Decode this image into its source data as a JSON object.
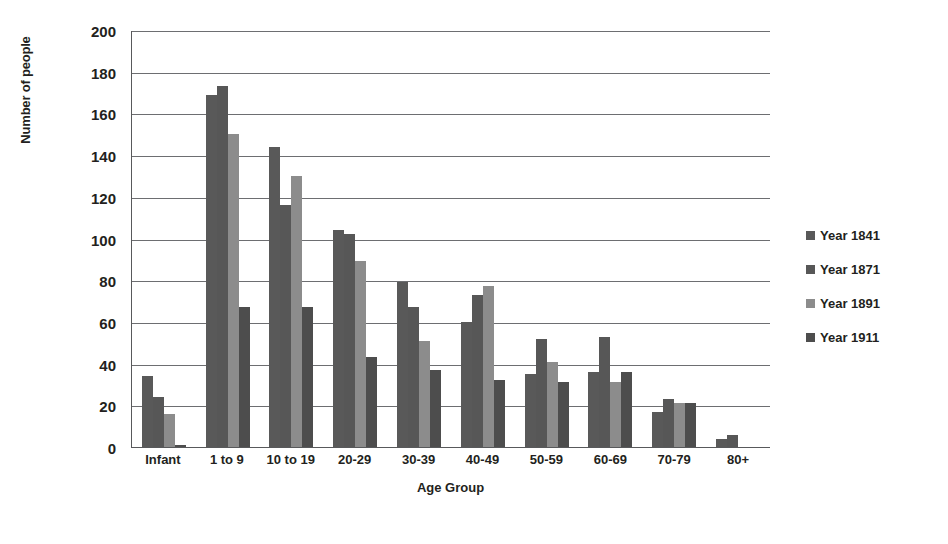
{
  "chart_data": {
    "type": "bar",
    "title": "",
    "xlabel": "Age Group",
    "ylabel": "Number of people",
    "ylim": [
      0,
      200
    ],
    "ytick_step": 20,
    "yticks": [
      200,
      180,
      160,
      140,
      120,
      100,
      80,
      60,
      40,
      20,
      0
    ],
    "grid": true,
    "legend_position": "right",
    "categories": [
      "Infant",
      "1 to 9",
      "10 to 19",
      "20-29",
      "30-39",
      "40-49",
      "50-59",
      "60-69",
      "70-79",
      "80+"
    ],
    "series": [
      {
        "name": "Year 1841",
        "color": "#595959",
        "values": [
          34,
          169,
          144,
          104,
          79,
          60,
          35,
          36,
          17,
          4
        ]
      },
      {
        "name": "Year 1871",
        "color": "#575757",
        "values": [
          24,
          173,
          116,
          102,
          67,
          73,
          52,
          53,
          23,
          6
        ]
      },
      {
        "name": "Year 1891",
        "color": "#8c8c8c",
        "values": [
          16,
          150,
          130,
          89,
          51,
          77,
          41,
          31,
          21,
          0
        ]
      },
      {
        "name": "Year 1911",
        "color": "#4d4d4d",
        "values": [
          1,
          67,
          67,
          43,
          37,
          32,
          31,
          36,
          21,
          0
        ]
      }
    ]
  },
  "colors": {
    "axis": "#58595b",
    "grid": "#6d6e71",
    "text": "#231f20",
    "background": "#ffffff"
  }
}
